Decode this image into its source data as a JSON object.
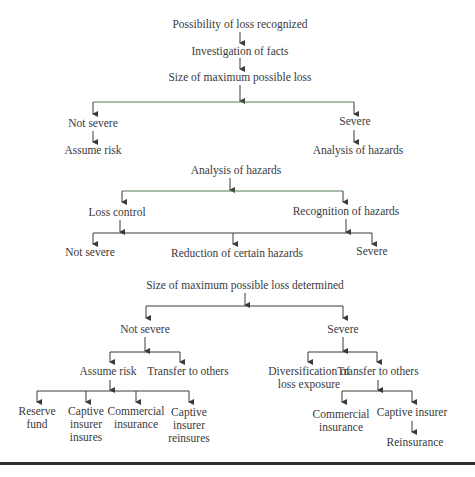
{
  "diagram": {
    "section1": {
      "root": "Possibility of loss recognized",
      "step2": "Investigation of facts",
      "step3": "Size of maximum possible loss",
      "left": "Not severe",
      "left_child": "Assume risk",
      "right": "Severe",
      "right_child": "Analysis of hazards"
    },
    "section2": {
      "root": "Analysis of hazards",
      "left": "Loss control",
      "right": "Recognition of hazards",
      "leaf1": "Not severe",
      "leaf2": "Reduction of certain hazards",
      "leaf3": "Severe"
    },
    "section3": {
      "root": "Size of maximum possible loss determined",
      "left": "Not severe",
      "right": "Severe",
      "left_a": "Assume risk",
      "left_b": "Transfer to others",
      "right_a_line1": "Diversification of",
      "right_a_line2": "loss exposure",
      "right_b": "Transfer to others",
      "assume_leaves": [
        {
          "line1": "Reserve",
          "line2": "fund",
          "line3": ""
        },
        {
          "line1": "Captive",
          "line2": "insurer",
          "line3": "insures"
        },
        {
          "line1": "Commercial",
          "line2": "insurance",
          "line3": ""
        },
        {
          "line1": "Captive",
          "line2": "insurer",
          "line3": "reinsures"
        }
      ],
      "transfer_leaves": [
        {
          "line1": "Commercial",
          "line2": "insurance"
        },
        {
          "line1": "Captive insurer",
          "line2": ""
        }
      ],
      "captive_child": "Reinsurance"
    }
  },
  "colors": {
    "line": "#3a3a3a",
    "accent_line": "#6fbf6f",
    "text": "#3a3a3a",
    "rule": "#2e2e2e"
  }
}
